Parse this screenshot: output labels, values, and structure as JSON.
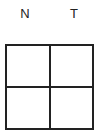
{
  "columns": [
    {
      "label": "N"
    },
    {
      "label": "T"
    }
  ],
  "grid": {
    "rows": 2,
    "cols": 2,
    "cells": [
      [
        "",
        ""
      ],
      [
        "",
        ""
      ]
    ]
  }
}
